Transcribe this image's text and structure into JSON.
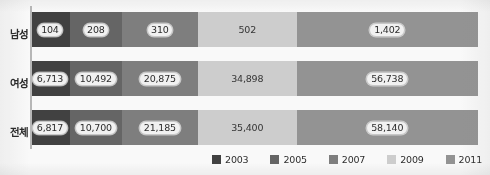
{
  "chart_data": {
    "type": "bar",
    "orientation": "horizontal",
    "stacked": true,
    "title": "",
    "subtitle": "",
    "xlabel": "",
    "ylabel": "",
    "grid": false,
    "legend_position": "bottom-right",
    "categories": [
      "남성",
      "여성",
      "전체"
    ],
    "series": [
      {
        "name": "2003",
        "color": "#3f3f3f",
        "values": [
          104,
          6713,
          6817
        ],
        "labels": [
          "104",
          "6,713",
          "6,817"
        ]
      },
      {
        "name": "2005",
        "color": "#646464",
        "values": [
          208,
          10492,
          10700
        ],
        "labels": [
          "208",
          "10,492",
          "10,700"
        ]
      },
      {
        "name": "2007",
        "color": "#7e7e7e",
        "values": [
          310,
          20875,
          21185
        ],
        "labels": [
          "310",
          "20,875",
          "21,185"
        ]
      },
      {
        "name": "2009",
        "color": "#cfcfcf",
        "values": [
          502,
          34898,
          35400
        ],
        "labels": [
          "502",
          "34,898",
          "35,400"
        ]
      },
      {
        "name": "2011",
        "color": "#949494",
        "values": [
          1402,
          56738,
          58140
        ],
        "labels": [
          "1,402",
          "56,738",
          "58,140"
        ]
      }
    ],
    "rows": [
      {
        "category": "남성",
        "segments": [
          {
            "year": "2003",
            "value": 104,
            "label": "104",
            "color": "#3f3f3f",
            "width_pct": 8.9,
            "label_style": "boxed"
          },
          {
            "year": "2005",
            "value": 208,
            "label": "208",
            "color": "#646464",
            "width_pct": 11.6,
            "label_style": "boxed"
          },
          {
            "year": "2007",
            "value": 310,
            "label": "310",
            "color": "#7e7e7e",
            "width_pct": 17.0,
            "label_style": "boxed"
          },
          {
            "year": "2009",
            "value": 502,
            "label": "502",
            "color": "#cfcfcf",
            "width_pct": 22.0,
            "label_style": "plain"
          },
          {
            "year": "2011",
            "value": 1402,
            "label": "1,402",
            "color": "#949494",
            "width_pct": 40.5,
            "label_style": "boxed"
          }
        ]
      },
      {
        "category": "여성",
        "segments": [
          {
            "year": "2003",
            "value": 6713,
            "label": "6,713",
            "color": "#3f3f3f",
            "width_pct": 8.9,
            "label_style": "boxed"
          },
          {
            "year": "2005",
            "value": 10492,
            "label": "10,492",
            "color": "#646464",
            "width_pct": 11.6,
            "label_style": "boxed"
          },
          {
            "year": "2007",
            "value": 20875,
            "label": "20,875",
            "color": "#7e7e7e",
            "width_pct": 17.0,
            "label_style": "boxed"
          },
          {
            "year": "2009",
            "value": 34898,
            "label": "34,898",
            "color": "#cfcfcf",
            "width_pct": 22.0,
            "label_style": "plain"
          },
          {
            "year": "2011",
            "value": 56738,
            "label": "56,738",
            "color": "#949494",
            "width_pct": 40.5,
            "label_style": "boxed"
          }
        ]
      },
      {
        "category": "전체",
        "segments": [
          {
            "year": "2003",
            "value": 6817,
            "label": "6,817",
            "color": "#3f3f3f",
            "width_pct": 8.9,
            "label_style": "boxed"
          },
          {
            "year": "2005",
            "value": 10700,
            "label": "10,700",
            "color": "#646464",
            "width_pct": 11.6,
            "label_style": "boxed"
          },
          {
            "year": "2007",
            "value": 21185,
            "label": "21,185",
            "color": "#7e7e7e",
            "width_pct": 17.0,
            "label_style": "boxed"
          },
          {
            "year": "2009",
            "value": 35400,
            "label": "35,400",
            "color": "#cfcfcf",
            "width_pct": 22.0,
            "label_style": "plain"
          },
          {
            "year": "2011",
            "value": 58140,
            "label": "58,140",
            "color": "#949494",
            "width_pct": 40.5,
            "label_style": "boxed"
          }
        ]
      }
    ],
    "legend": [
      {
        "label": "2003",
        "color": "#3f3f3f"
      },
      {
        "label": "2005",
        "color": "#646464"
      },
      {
        "label": "2007",
        "color": "#7e7e7e"
      },
      {
        "label": "2009",
        "color": "#cfcfcf"
      },
      {
        "label": "2011",
        "color": "#949494"
      }
    ]
  }
}
